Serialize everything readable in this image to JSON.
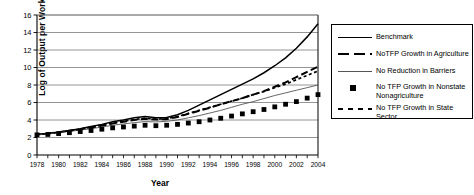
{
  "chart_data": {
    "type": "line",
    "title": "",
    "xlabel": "Year",
    "ylabel": "Log of Output per Worker",
    "xlim": [
      1978,
      2004
    ],
    "ylim": [
      0,
      16
    ],
    "ytick_step": 2,
    "yticks": [
      "0",
      "2",
      "4",
      "6",
      "8",
      "10",
      "12",
      "14",
      "16"
    ],
    "xticks": [
      "1978",
      "1980",
      "1982",
      "1984",
      "1986",
      "1988",
      "1990",
      "1992",
      "1994",
      "1996",
      "1998",
      "2000",
      "2002",
      "2004"
    ],
    "xtick_minor_every": 1,
    "grid": "horizontal",
    "legend_position": "right-outside",
    "x": [
      1978,
      1979,
      1980,
      1981,
      1982,
      1983,
      1984,
      1985,
      1986,
      1987,
      1988,
      1989,
      1990,
      1991,
      1992,
      1993,
      1994,
      1995,
      1996,
      1997,
      1998,
      1999,
      2000,
      2001,
      2002,
      2003,
      2004
    ],
    "series": [
      {
        "name": "Benchmark",
        "style": "solid",
        "values": [
          2.35,
          2.45,
          2.6,
          2.8,
          3.0,
          3.25,
          3.5,
          3.8,
          4.0,
          4.25,
          4.4,
          4.25,
          4.3,
          4.6,
          5.1,
          5.7,
          6.3,
          6.9,
          7.5,
          8.1,
          8.7,
          9.4,
          10.2,
          11.1,
          12.2,
          13.5,
          15.0
        ]
      },
      {
        "name": "NoTFP Growth in Agriculture",
        "style": "dashed",
        "values": [
          2.35,
          2.45,
          2.6,
          2.78,
          2.95,
          3.15,
          3.35,
          3.6,
          3.8,
          4.0,
          4.15,
          4.05,
          4.1,
          4.35,
          4.7,
          5.05,
          5.4,
          5.8,
          6.15,
          6.5,
          6.9,
          7.3,
          7.8,
          8.3,
          8.9,
          9.5,
          10.1
        ]
      },
      {
        "name": "No Reduction in Barriers",
        "style": "thin-solid",
        "values": [
          2.35,
          2.42,
          2.55,
          2.7,
          2.85,
          3.0,
          3.2,
          3.4,
          3.55,
          3.7,
          3.82,
          3.78,
          3.85,
          4.0,
          4.25,
          4.5,
          4.8,
          5.1,
          5.45,
          5.8,
          6.1,
          6.45,
          6.8,
          7.1,
          7.4,
          7.7,
          8.0
        ]
      },
      {
        "name": "No TFP Growth in Nonstate Nonagriculture",
        "style": "square-markers",
        "values": [
          2.3,
          2.35,
          2.45,
          2.55,
          2.68,
          2.8,
          2.95,
          3.1,
          3.2,
          3.3,
          3.4,
          3.35,
          3.4,
          3.5,
          3.65,
          3.8,
          4.0,
          4.2,
          4.45,
          4.7,
          4.95,
          5.2,
          5.5,
          5.8,
          6.1,
          6.5,
          6.9
        ]
      },
      {
        "name": "No TFP Growth in State Sector",
        "style": "dotted",
        "values": [
          2.35,
          2.45,
          2.6,
          2.78,
          2.95,
          3.18,
          3.4,
          3.65,
          3.85,
          4.05,
          4.2,
          4.1,
          4.15,
          4.4,
          4.75,
          5.1,
          5.45,
          5.8,
          6.15,
          6.5,
          6.9,
          7.25,
          7.7,
          8.1,
          8.6,
          9.1,
          9.6
        ]
      }
    ],
    "legend": [
      {
        "label": "Benchmark",
        "key": "solid-line-key"
      },
      {
        "label": "NoTFP Growth in Agriculture",
        "key": "dashed-line-key"
      },
      {
        "label": "No Reduction in Barriers",
        "key": "thin-line-key"
      },
      {
        "label": "No TFP Growth in Nonstate\nNonagriculture",
        "key": "square-marker-key"
      },
      {
        "label": "No TFP Growth in State Sector",
        "key": "dotted-line-key"
      }
    ],
    "colors": {
      "ink": "#000000",
      "grid": "#7a7a7a",
      "thin_series": "#555555"
    }
  }
}
